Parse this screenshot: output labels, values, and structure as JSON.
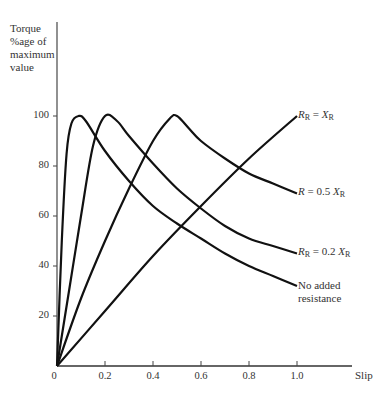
{
  "chart_data": {
    "type": "line",
    "title": "",
    "ylabel": "Torque %age of maximum value",
    "ylabel_lines": [
      "Torque",
      "%age of",
      "maximum",
      "value"
    ],
    "xlabel": "Slip",
    "xlim": [
      0,
      1.0
    ],
    "ylim": [
      0,
      100
    ],
    "x_ticks": [
      "0",
      "0.2",
      "0.4",
      "0.6",
      "0.8",
      "1.0"
    ],
    "y_ticks": [
      "20",
      "40",
      "60",
      "80",
      "100"
    ],
    "grid": false,
    "legend_position": "inline-right",
    "series": [
      {
        "name": "No added resistance",
        "label_lines": [
          "No added",
          "resistance"
        ],
        "peak_slip": 0.09,
        "x": [
          0,
          0.02,
          0.04,
          0.06,
          0.09,
          0.12,
          0.2,
          0.3,
          0.4,
          0.5,
          0.6,
          0.7,
          0.8,
          0.9,
          1.0
        ],
        "y": [
          0,
          50,
          85,
          97,
          100,
          98,
          86,
          74,
          64,
          57,
          51,
          45,
          40,
          36,
          32
        ]
      },
      {
        "name": "R_R = 0.2 X_R",
        "label": "R",
        "label_sub": "R",
        "label_rest": " = 0.2 X",
        "label_sub2": "R",
        "peak_slip": 0.2,
        "x": [
          0,
          0.05,
          0.1,
          0.15,
          0.2,
          0.25,
          0.3,
          0.4,
          0.5,
          0.6,
          0.7,
          0.8,
          0.9,
          1.0
        ],
        "y": [
          0,
          30,
          60,
          88,
          100,
          98,
          92,
          81,
          71,
          63,
          56,
          51,
          48,
          45
        ]
      },
      {
        "name": "R = 0.5 X_R",
        "label": "R",
        "label_sub": "",
        "label_rest": " = 0.5 X",
        "label_sub2": "R",
        "peak_slip": 0.5,
        "x": [
          0,
          0.1,
          0.2,
          0.3,
          0.4,
          0.47,
          0.5,
          0.55,
          0.6,
          0.7,
          0.8,
          0.9,
          1.0
        ],
        "y": [
          0,
          27,
          50,
          71,
          90,
          99,
          100,
          95,
          90,
          83,
          77,
          73,
          69
        ]
      },
      {
        "name": "R_R = X_R",
        "label": "R",
        "label_sub": "R",
        "label_rest": " = X",
        "label_sub2": "R",
        "peak_slip": 1.0,
        "x": [
          0,
          0.2,
          0.4,
          0.6,
          0.8,
          1.0
        ],
        "y": [
          0,
          22,
          44,
          64,
          83,
          100
        ]
      }
    ]
  }
}
